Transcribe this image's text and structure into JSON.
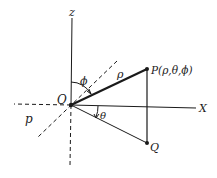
{
  "diagram": {
    "labels": {
      "z_axis": "z",
      "x_axis": "X",
      "origin": "O",
      "point_p": "P(ρ,θ,ϕ)",
      "point_q": "Q",
      "rho_segment": "ρ",
      "phi_angle": "ϕ",
      "theta_angle": "θ",
      "plane": "p"
    },
    "colors": {
      "line": "#1a1a1a",
      "background": "#ffffff"
    }
  }
}
